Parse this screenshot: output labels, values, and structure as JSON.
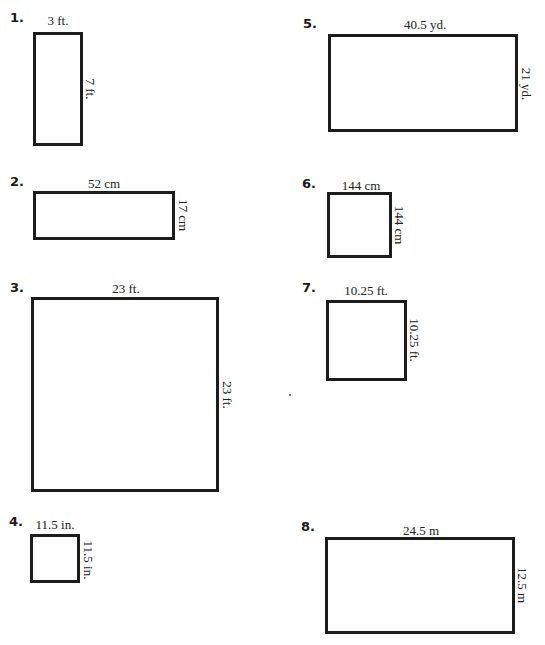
{
  "worksheet": {
    "problems": [
      {
        "number": "1.",
        "width_label": "3 ft.",
        "height_label": "7 ft.",
        "shape": "rectangle"
      },
      {
        "number": "2.",
        "width_label": "52 cm",
        "height_label": "17 cm",
        "shape": "rectangle"
      },
      {
        "number": "3.",
        "width_label": "23 ft.",
        "height_label": "23 ft.",
        "shape": "square"
      },
      {
        "number": "4.",
        "width_label": "11.5 in.",
        "height_label": "11.5 in.",
        "shape": "square"
      },
      {
        "number": "5.",
        "width_label": "40.5 yd.",
        "height_label": "21 yd.",
        "shape": "rectangle"
      },
      {
        "number": "6.",
        "width_label": "144 cm",
        "height_label": "144 cm",
        "shape": "square"
      },
      {
        "number": "7.",
        "width_label": "10.25 ft.",
        "height_label": "10.25 ft.",
        "shape": "square"
      },
      {
        "number": "8.",
        "width_label": "24.5 m",
        "height_label": "12.5 m",
        "shape": "rectangle"
      }
    ]
  }
}
